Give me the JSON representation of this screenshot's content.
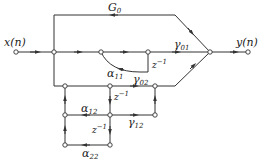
{
  "diagram": {
    "type": "signal-flow-graph",
    "input_label": "x(n)",
    "output_label": "y(n)",
    "labels": {
      "g0": {
        "main": "G",
        "sub": "0"
      },
      "gamma01": {
        "main": "γ",
        "sub": "01"
      },
      "gamma02": {
        "main": "γ",
        "sub": "02"
      },
      "alpha11": {
        "main": "α",
        "sub": "11"
      },
      "alpha12": {
        "main": "α",
        "sub": "12"
      },
      "gamma12": {
        "main": "γ",
        "sub": "12"
      },
      "alpha22": {
        "main": "α",
        "sub": "22"
      },
      "delay1": {
        "main": "z",
        "sup": "−1"
      },
      "delay2": {
        "main": "z",
        "sup": "−1"
      },
      "delay3": {
        "main": "z",
        "sup": "−1"
      }
    },
    "colors": {
      "line": "#333333",
      "node_fill": "#ffffff"
    }
  }
}
